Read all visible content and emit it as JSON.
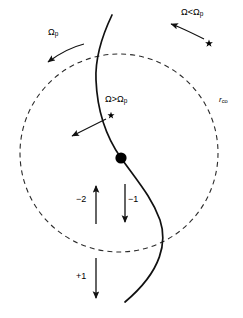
{
  "figure": {
    "background_color": "#ffffff",
    "ink_color": "#000000",
    "width": 243,
    "height": 318
  },
  "labels": {
    "pattern_speed": "Ω",
    "pattern_speed_sub": "p",
    "outside_corotation": "Ω<Ω",
    "outside_corotation_sub": "p",
    "inside_corotation": "Ω>Ω",
    "inside_corotation_sub": "p",
    "corotation_radius": "r",
    "corotation_radius_sub": "co",
    "resonance_minus_two": "−2",
    "resonance_minus_one": "−1",
    "resonance_plus_one": "+1"
  },
  "geometry": {
    "corotation_circle": {
      "center_x": 119,
      "center_y": 153,
      "radius": 99,
      "stroke": "#2b2b2b",
      "dash": "5 4",
      "stroke_width": 1.1
    },
    "spiral_arm": {
      "path": "M 112 15 C 101 38 95 58 96 80 C 97 105 104 134 121 158 C 139 183 152 198 160 220 C 167 241 163 270 125 302",
      "stroke": "#111111",
      "stroke_width": 1.7
    },
    "corotation_point": {
      "x": 121,
      "y": 158,
      "radius": 5.6,
      "fill": "#000000"
    },
    "star_outside": {
      "x": 209,
      "y": 43,
      "size": 3.1
    },
    "star_inside": {
      "x": 111,
      "y": 115,
      "size": 2.8
    },
    "arrow_pattern_speed": {
      "path": "M 84 44 C 72 47 60 53 48 62",
      "tip_x": 44,
      "tip_y": 65
    },
    "arrow_outside": {
      "path": "M 204 39 C 192 33 180 27 171 24",
      "tip_x": 166,
      "tip_y": 22
    },
    "arrow_inside": {
      "path": "M 106 119 C 94 125 82 131 72 136",
      "tip_x": 66,
      "tip_y": 139
    },
    "arrow_minus_two": {
      "x": 96,
      "y_tail": 224,
      "y_tip": 184
    },
    "arrow_minus_one": {
      "x": 125,
      "y_tail": 184,
      "y_tip": 224
    },
    "arrow_plus_one": {
      "x": 96,
      "y_tail": 258,
      "y_tip": 300
    }
  },
  "label_positions": {
    "pattern_speed": {
      "x": 48,
      "y": 34
    },
    "outside_corotation": {
      "x": 181,
      "y": 12
    },
    "inside_corotation": {
      "x": 105,
      "y": 99
    },
    "corotation_radius": {
      "x": 219,
      "y": 100
    },
    "resonance_minus_two": {
      "x": 76,
      "y": 199
    },
    "resonance_minus_one": {
      "x": 128,
      "y": 199
    },
    "resonance_plus_one": {
      "x": 78,
      "y": 276
    }
  }
}
